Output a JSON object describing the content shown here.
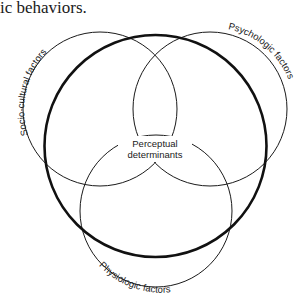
{
  "header": {
    "text": "ic behaviors."
  },
  "diagram": {
    "circles": [
      {
        "name": "socio-cultural",
        "label": "Socio-cultural factors"
      },
      {
        "name": "psychologic",
        "label": "Psychologic factors"
      },
      {
        "name": "physiologic",
        "label": "Physiologic factors"
      },
      {
        "name": "perceptual",
        "label": "Perceptual determinants"
      }
    ],
    "center_label_line1": "Perceptual",
    "center_label_line2": "determinants",
    "labels": {
      "socio_cultural": "Socio-cultural factors",
      "psychologic": "Psychologic factors",
      "physiologic": "Physiologic factors"
    },
    "colors": {
      "line": "#1a1a1a",
      "background": "#ffffff"
    }
  }
}
